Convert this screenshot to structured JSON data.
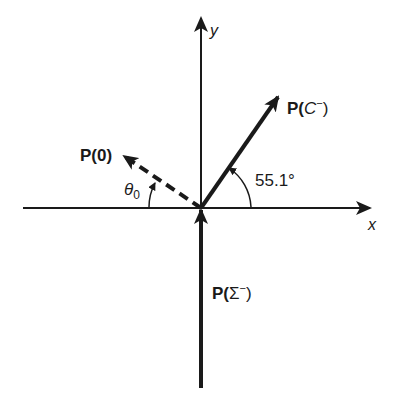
{
  "diagram": {
    "axes": {
      "x_label": "x",
      "y_label": "y"
    },
    "vectors": [
      {
        "id": "p-c-minus",
        "label_prefix": "P(",
        "label_var": "C",
        "label_sup": "−",
        "label_suffix": ")",
        "style": "solid",
        "angle_label": "55.1°"
      },
      {
        "id": "p-zero",
        "label": "P(0)",
        "style": "dashed",
        "angle_label_base": "θ",
        "angle_label_sub": "0"
      },
      {
        "id": "p-sigma-minus",
        "label_prefix": "P(",
        "label_var": "Σ",
        "label_sup": "−",
        "label_suffix": ")",
        "style": "solid"
      }
    ],
    "colors": {
      "ink": "#1a1a1a",
      "background": "#ffffff"
    }
  }
}
